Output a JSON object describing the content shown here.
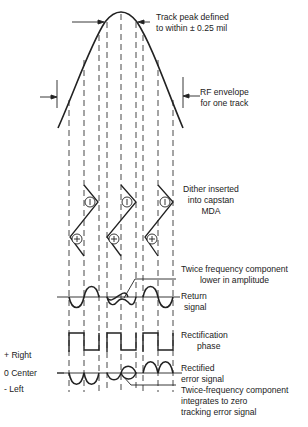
{
  "labels": {
    "track_peak": [
      "Track peak defined",
      "to within ± 0.25 mil"
    ],
    "rf_envelope": [
      "RF envelope",
      "for one track"
    ],
    "dither": [
      "Dither inserted",
      "into capstan",
      "MDA"
    ],
    "twice_freq_lower": [
      "Twice frequency component",
      "lower in amplitude"
    ],
    "return_signal": [
      "Return",
      "signal"
    ],
    "rectification_phase": [
      "Rectification",
      "phase"
    ],
    "rectified_error": [
      "Rectified",
      "error signal"
    ],
    "twice_freq_integrates": [
      "Twice-frequency component",
      "integrates to zero",
      "tracking error signal"
    ],
    "axis_right": "+ Right",
    "axis_center": "0 Center",
    "axis_left": "- Left"
  },
  "symbols": {
    "minus": "−",
    "plus": "+"
  },
  "colors": {
    "line": "#222222",
    "dash": "#333333",
    "background": "#ffffff"
  }
}
